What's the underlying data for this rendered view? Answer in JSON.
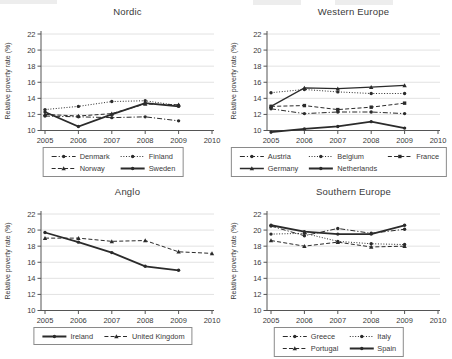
{
  "figure": {
    "ylabel": "Relative poverty rate (%)",
    "line_color": "#2b2b2b",
    "grid_color": "#e2e2e2",
    "axis_color": "#555555",
    "text_color": "#3a3a3a"
  },
  "chart_data": [
    {
      "type": "line",
      "title": "Nordic",
      "ylabel": "Relative poverty rate (%)",
      "x": [
        2005,
        2006,
        2007,
        2008,
        2009
      ],
      "xlim": [
        2005,
        2010
      ],
      "ylim": [
        10,
        22
      ],
      "ytick_step": 2,
      "xticks": [
        2005,
        2006,
        2007,
        2008,
        2009,
        2010
      ],
      "grid": "horizontal",
      "legend_position": "bottom",
      "legend_columns": 2,
      "series": [
        {
          "name": "Denmark",
          "values": [
            11.8,
            11.7,
            11.6,
            11.7,
            11.2
          ],
          "line_style": "dashdot",
          "marker": "circle",
          "width": 1
        },
        {
          "name": "Finland",
          "values": [
            12.6,
            13.0,
            13.6,
            13.7,
            13.1
          ],
          "line_style": "dotted",
          "marker": "circle",
          "width": 1
        },
        {
          "name": "Norway",
          "values": [
            12.0,
            11.8,
            12.1,
            13.3,
            13.2
          ],
          "line_style": "dashed",
          "marker": "triangle",
          "width": 1
        },
        {
          "name": "Sweden",
          "values": [
            12.3,
            10.5,
            12.0,
            13.4,
            13.0
          ],
          "line_style": "solid",
          "marker": "circle",
          "width": 1.8
        }
      ]
    },
    {
      "type": "line",
      "title": "Western Europe",
      "ylabel": "Relative poverty rate (%)",
      "x": [
        2005,
        2006,
        2007,
        2008,
        2009
      ],
      "xlim": [
        2005,
        2010
      ],
      "ylim": [
        10,
        22
      ],
      "ytick_step": 2,
      "xticks": [
        2005,
        2006,
        2007,
        2008,
        2009,
        2010
      ],
      "grid": "horizontal",
      "legend_position": "bottom",
      "legend_columns": 3,
      "series": [
        {
          "name": "Austria",
          "values": [
            12.7,
            12.1,
            12.3,
            12.3,
            12.1
          ],
          "line_style": "dashdot",
          "marker": "circle",
          "width": 1
        },
        {
          "name": "Belgium",
          "values": [
            14.7,
            15.1,
            14.8,
            14.6,
            14.6
          ],
          "line_style": "dotted",
          "marker": "circle",
          "width": 1
        },
        {
          "name": "France",
          "values": [
            13.0,
            13.1,
            12.6,
            12.9,
            13.4
          ],
          "line_style": "dashed",
          "marker": "square",
          "width": 1
        },
        {
          "name": "Germany",
          "values": [
            13.0,
            15.3,
            15.2,
            15.4,
            15.6
          ],
          "line_style": "solid",
          "marker": "triangle",
          "width": 1.3
        },
        {
          "name": "Netherlands",
          "values": [
            9.8,
            10.2,
            10.5,
            11.1,
            10.3
          ],
          "line_style": "solid",
          "marker": "circle",
          "width": 1.8
        }
      ]
    },
    {
      "type": "line",
      "title": "Anglo",
      "ylabel": "Relative poverty rate (%)",
      "x": [
        2005,
        2006,
        2007,
        2008,
        2009
      ],
      "xlim": [
        2005,
        2010
      ],
      "ylim": [
        10,
        22
      ],
      "ytick_step": 2,
      "xticks": [
        2005,
        2006,
        2007,
        2008,
        2009,
        2010
      ],
      "grid": "horizontal",
      "legend_position": "bottom",
      "legend_columns": 2,
      "series": [
        {
          "name": "Ireland",
          "values": [
            19.7,
            18.5,
            17.2,
            15.5,
            15.0
          ],
          "line_style": "solid",
          "marker": "circle",
          "width": 1.8
        },
        {
          "name": "United Kingdom",
          "x": [
            2005,
            2006,
            2007,
            2008,
            2009,
            2010
          ],
          "values": [
            19.0,
            19.0,
            18.6,
            18.7,
            17.3,
            17.1
          ],
          "line_style": "dashed",
          "marker": "triangle",
          "width": 1
        }
      ]
    },
    {
      "type": "line",
      "title": "Southern Europe",
      "ylabel": "Relative poverty rate (%)",
      "x": [
        2005,
        2006,
        2007,
        2008,
        2009
      ],
      "xlim": [
        2005,
        2010
      ],
      "ylim": [
        10,
        22
      ],
      "ytick_step": 2,
      "xticks": [
        2005,
        2006,
        2007,
        2008,
        2009,
        2010
      ],
      "grid": "horizontal",
      "legend_position": "bottom",
      "legend_columns": 2,
      "series": [
        {
          "name": "Greece",
          "values": [
            20.5,
            19.3,
            20.2,
            19.6,
            20.1
          ],
          "line_style": "dashdot",
          "marker": "circle",
          "width": 1
        },
        {
          "name": "Italy",
          "values": [
            19.5,
            19.6,
            18.6,
            18.3,
            18.2
          ],
          "line_style": "dotted",
          "marker": "circle",
          "width": 1
        },
        {
          "name": "Portugal",
          "values": [
            18.7,
            18.0,
            18.5,
            17.9,
            18.0
          ],
          "line_style": "dashed",
          "marker": "triangle",
          "width": 1
        },
        {
          "name": "Spain",
          "values": [
            20.6,
            19.8,
            19.5,
            19.5,
            20.6
          ],
          "line_style": "solid",
          "marker": "circle",
          "width": 1.8
        }
      ]
    }
  ]
}
